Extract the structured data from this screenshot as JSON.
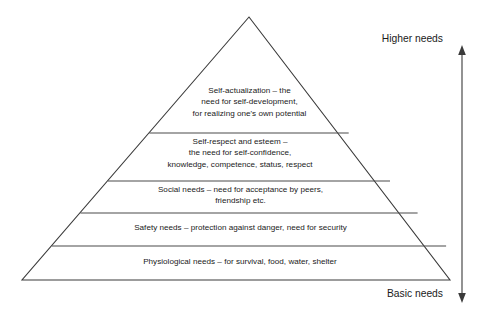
{
  "diagram": {
    "type": "pyramid-hierarchy",
    "background_color": "#ffffff",
    "line_color": "#3a3a3a",
    "text_color": "#1a1a1a",
    "geometry": {
      "apex": {
        "x": 249,
        "y": 17
      },
      "base_left": {
        "x": 22,
        "y": 280
      },
      "base_right": {
        "x": 450,
        "y": 280
      },
      "divider_y": [
        133,
        181,
        213,
        246
      ]
    },
    "tiers": [
      {
        "id": "self-actualization",
        "rank": 5,
        "name": "Self-actualization",
        "text": "Self-actualization – the\nneed for self-development,\nfor realizing one's own potential"
      },
      {
        "id": "self-respect-and-esteem",
        "rank": 4,
        "name": "Self-respect and esteem",
        "text": "Self-respect and esteem –\nthe need for self-confidence,\nknowledge, competence, status, respect"
      },
      {
        "id": "social-needs",
        "rank": 3,
        "name": "Social needs",
        "text": "Social needs – need for acceptance by peers,\nfriendship etc."
      },
      {
        "id": "safety-needs",
        "rank": 2,
        "name": "Safety needs",
        "text": "Safety needs – protection against danger, need for security"
      },
      {
        "id": "physiological-needs",
        "rank": 1,
        "name": "Physiological needs",
        "text": "Physiological needs – for survival, food, water, shelter"
      }
    ],
    "axis": {
      "top_label": "Higher needs",
      "bottom_label": "Basic needs",
      "arrow": {
        "x": 462,
        "y_top": 48,
        "y_bottom": 300,
        "double_headed": true
      }
    }
  }
}
